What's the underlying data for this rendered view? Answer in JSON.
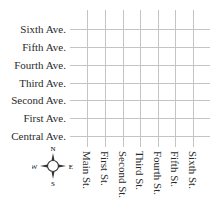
{
  "avenues": [
    {
      "label": "Sixth Ave.",
      "y": 29
    },
    {
      "label": "Fifth Ave.",
      "y": 47
    },
    {
      "label": "Fourth Ave.",
      "y": 65
    },
    {
      "label": "Third Ave.",
      "y": 83
    },
    {
      "label": "Second Ave.",
      "y": 100
    },
    {
      "label": "First Ave.",
      "y": 118
    },
    {
      "label": "Central Ave.",
      "y": 136
    }
  ],
  "streets": [
    {
      "label": "Main St.",
      "x": 87
    },
    {
      "label": "First St.",
      "x": 105
    },
    {
      "label": "Second St.",
      "x": 123
    },
    {
      "label": "Third St.",
      "x": 140
    },
    {
      "label": "Fourth St.",
      "x": 158
    },
    {
      "label": "Fifth St.",
      "x": 175
    },
    {
      "label": "Sixth St.",
      "x": 193
    }
  ],
  "compass": {
    "n": "N",
    "s": "S",
    "e": "E",
    "w": "W"
  },
  "colors": {
    "grid": "#c4c4c4",
    "text": "#2a2a2a"
  }
}
